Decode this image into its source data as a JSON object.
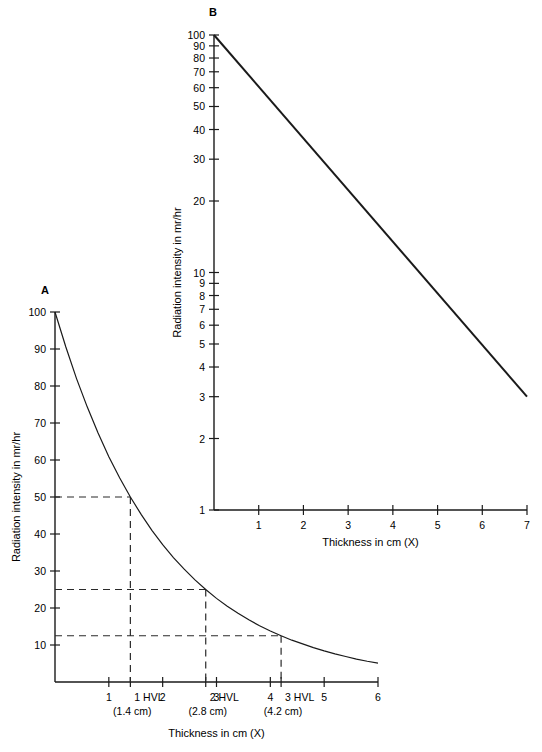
{
  "figure": {
    "panel_a_label": "A",
    "panel_b_label": "B"
  },
  "chart_data": [
    {
      "id": "panel_a",
      "type": "line",
      "title": "A",
      "xlabel": "Thickness in cm (X)",
      "ylabel": "Radiation intensity in mr/hr",
      "xlim": [
        0,
        6
      ],
      "ylim": [
        0,
        100
      ],
      "yscale": "linear",
      "xscale": "linear",
      "grid": false,
      "legend": "none",
      "xticks": [
        1,
        2,
        3,
        4,
        5,
        6
      ],
      "xticklabels": [
        "1",
        "2",
        "3",
        "4",
        "5",
        "6"
      ],
      "yticks": [
        10,
        20,
        30,
        40,
        50,
        60,
        70,
        80,
        90,
        100
      ],
      "yticklabels": [
        "10",
        "20",
        "30",
        "40",
        "50",
        "60",
        "70",
        "80",
        "90",
        "100"
      ],
      "curve_formula": "I = 100 * 2^(-x/1.4)",
      "half_value_layer_cm": 1.4,
      "x": [
        0,
        0.2,
        0.4,
        0.6,
        0.8,
        1.0,
        1.2,
        1.4,
        1.6,
        1.8,
        2.0,
        2.2,
        2.4,
        2.6,
        2.8,
        3.0,
        3.2,
        3.4,
        3.6,
        3.8,
        4.0,
        4.2,
        4.4,
        4.6,
        4.8,
        5.0,
        5.2,
        5.4,
        5.6,
        5.8,
        6.0
      ],
      "y": [
        100,
        90.6,
        82.0,
        74.3,
        67.3,
        60.9,
        55.2,
        50.0,
        45.3,
        41.0,
        37.1,
        33.6,
        30.5,
        27.6,
        25.0,
        22.6,
        20.5,
        18.6,
        16.8,
        15.2,
        13.8,
        12.5,
        11.3,
        10.3,
        9.3,
        8.4,
        7.6,
        6.9,
        6.2,
        5.6,
        5.1
      ],
      "annotations": [
        {
          "name": "1 HVL",
          "label_line1": "1 HVL",
          "label_line2": "(1.4 cm)",
          "x": 1.4,
          "y": 50
        },
        {
          "name": "2 HVL",
          "label_line1": "2 HVL",
          "label_line2": "(2.8 cm)",
          "x": 2.8,
          "y": 25
        },
        {
          "name": "3 HVL",
          "label_line1": "3 HVL",
          "label_line2": "(4.2 cm)",
          "x": 4.2,
          "y": 12.5
        }
      ],
      "guide_values_y": [
        50,
        25,
        12.5
      ]
    },
    {
      "id": "panel_b",
      "type": "line",
      "title": "B",
      "xlabel": "Thickness in cm (X)",
      "ylabel": "Radiation intensity in mr/hr",
      "xlim": [
        0,
        7
      ],
      "ylim": [
        1,
        100
      ],
      "yscale": "log",
      "xscale": "linear",
      "grid": false,
      "legend": "none",
      "xticks": [
        1,
        2,
        3,
        4,
        5,
        6,
        7
      ],
      "xticklabels": [
        "1",
        "2",
        "3",
        "4",
        "5",
        "6",
        "7"
      ],
      "yticks": [
        1,
        2,
        3,
        4,
        5,
        6,
        7,
        8,
        9,
        10,
        20,
        30,
        40,
        50,
        60,
        70,
        80,
        90,
        100
      ],
      "yticklabels": [
        "1",
        "2",
        "3",
        "4",
        "5",
        "6",
        "7",
        "8",
        "9",
        "10",
        "20",
        "30",
        "40",
        "50",
        "60",
        "70",
        "80",
        "90",
        "100"
      ],
      "x": [
        0,
        7
      ],
      "y": [
        100,
        3.0
      ]
    }
  ]
}
